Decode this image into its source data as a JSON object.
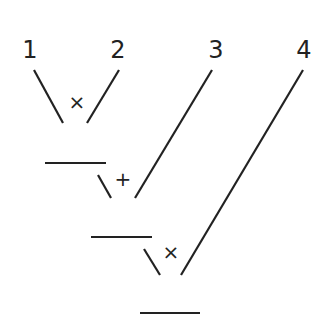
{
  "diagram": {
    "type": "expression-tree",
    "stroke_color": "#222222",
    "background": "#ffffff",
    "leaves": [
      {
        "label": "1",
        "x": 30,
        "y": 58
      },
      {
        "label": "2",
        "x": 118,
        "y": 58
      },
      {
        "label": "3",
        "x": 216,
        "y": 58
      },
      {
        "label": "4",
        "x": 304,
        "y": 58
      }
    ],
    "operators": [
      {
        "symbol": "×",
        "x": 77,
        "y": 109
      },
      {
        "symbol": "+",
        "x": 123,
        "y": 186
      },
      {
        "symbol": "×",
        "x": 171,
        "y": 259
      }
    ],
    "result_blanks": 3
  }
}
